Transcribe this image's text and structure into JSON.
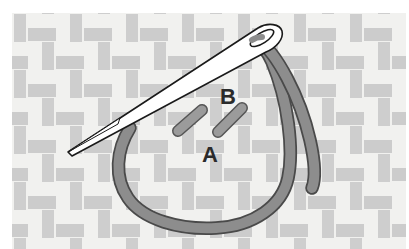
{
  "illustration": {
    "title": "Chain stitch technique diagram",
    "subject": "needle-and-thread-on-woven-fabric",
    "canvas": {
      "width": 409,
      "height": 249
    },
    "background_color": "#ffffff"
  },
  "fabric": {
    "name": "woven-fabric-swatch",
    "base_color": "#f0f0ee",
    "thread_warp_color": "#c9c9c9",
    "thread_weft_color": "#c4c4c4",
    "weave_pattern": "basket-weave",
    "bounds": {
      "x": 12,
      "y": 13,
      "width": 394,
      "height": 236
    },
    "cell_size": 56,
    "band_thickness": 13
  },
  "needle": {
    "name": "sewing-needle",
    "body_color": "#ffffff",
    "outline_color": "#1a1a1a",
    "tip_point": {
      "x": 68,
      "y": 152
    },
    "eye_point": {
      "x": 274,
      "y": 37
    },
    "eye_color": "#ffffff"
  },
  "thread": {
    "name": "embroidery-thread",
    "fill_color": "#8d8d8d",
    "outline_color": "#4a4a4a",
    "width": 11,
    "loop_description": "open loop from point A curving down and around to the needle eye",
    "tail_description": "free thread tail hanging to the right of the needle eye"
  },
  "stitch_marks": [
    {
      "name": "stitch-mark-left",
      "fill_color": "#9b9b9b",
      "outline_color": "#555555",
      "x1": 178,
      "y1": 130,
      "x2": 202,
      "y2": 110
    },
    {
      "name": "stitch-mark-right",
      "fill_color": "#9b9b9b",
      "outline_color": "#555555",
      "x1": 218,
      "y1": 131,
      "x2": 242,
      "y2": 108
    }
  ],
  "labels": [
    {
      "id": "label-a",
      "text": "A",
      "x": 210,
      "y": 162,
      "font_size": 22,
      "color": "#2b2b2b"
    },
    {
      "id": "label-b",
      "text": "B",
      "x": 228,
      "y": 104,
      "font_size": 22,
      "color": "#2b2b2b"
    }
  ]
}
